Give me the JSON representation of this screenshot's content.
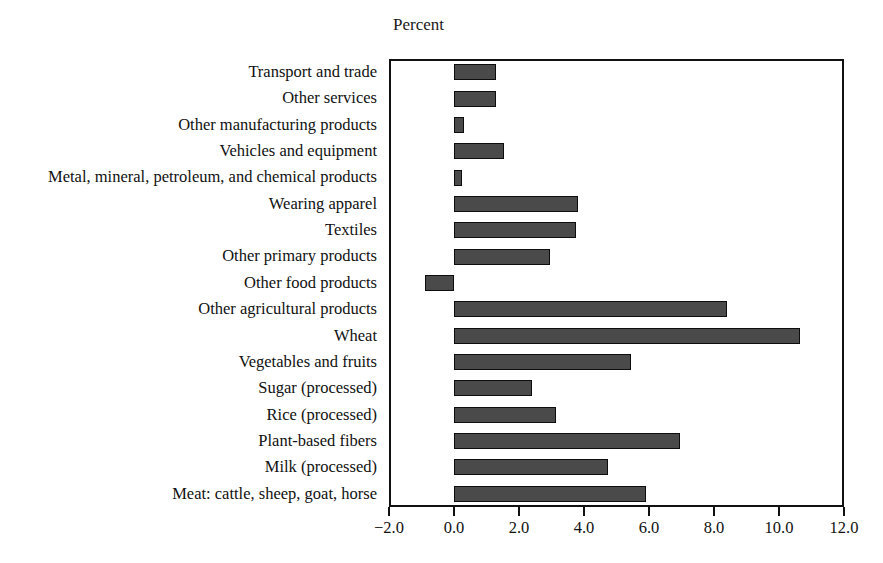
{
  "chart_data": {
    "type": "bar",
    "orientation": "horizontal",
    "title": "",
    "axis_title": "Percent",
    "xlabel": "Percent",
    "ylabel": "",
    "xlim": [
      -2.0,
      12.0
    ],
    "xticks": [
      "−2.0",
      "0.0",
      "2.0",
      "4.0",
      "6.0",
      "8.0",
      "10.0",
      "12.0"
    ],
    "xtick_values": [
      -2.0,
      0.0,
      2.0,
      4.0,
      6.0,
      8.0,
      10.0,
      12.0
    ],
    "grid": false,
    "legend": "none",
    "bar_color": "#4a4a4a",
    "bar_edge_color": "#0d0d0d",
    "frame_color": "#111111",
    "categories": [
      "Transport and trade",
      "Other services",
      "Other manufacturing products",
      "Vehicles and equipment",
      "Metal, mineral, petroleum, and chemical products",
      "Wearing apparel",
      "Textiles",
      "Other primary products",
      "Other food products",
      "Other agricultural products",
      "Wheat",
      "Vegetables and fruits",
      "Sugar (processed)",
      "Rice (processed)",
      "Plant-based fibers",
      "Milk (processed)",
      "Meat: cattle, sheep, goat, horse"
    ],
    "values": [
      1.3,
      1.3,
      0.3,
      1.55,
      0.25,
      3.8,
      3.75,
      2.95,
      -0.9,
      8.4,
      10.65,
      5.45,
      2.4,
      3.15,
      6.95,
      4.75,
      5.9
    ]
  }
}
